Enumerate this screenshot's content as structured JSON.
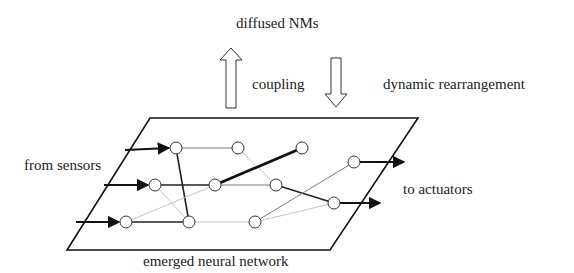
{
  "labels": {
    "top": "diffused NMs",
    "coupling": "coupling",
    "rearrangement": "dynamic rearrangement",
    "inputs": "from sensors",
    "outputs": "to actuators",
    "bottom": "emerged neural network"
  },
  "diagram": {
    "plane": [
      [
        150,
        118
      ],
      [
        418,
        118
      ],
      [
        330,
        250
      ],
      [
        67,
        250
      ]
    ],
    "nodes": [
      {
        "id": "A",
        "x": 176,
        "y": 148
      },
      {
        "id": "B",
        "x": 238,
        "y": 148
      },
      {
        "id": "C",
        "x": 302,
        "y": 148
      },
      {
        "id": "D",
        "x": 155,
        "y": 185
      },
      {
        "id": "E",
        "x": 215,
        "y": 185
      },
      {
        "id": "F",
        "x": 276,
        "y": 185
      },
      {
        "id": "G",
        "x": 354,
        "y": 162
      },
      {
        "id": "H",
        "x": 126,
        "y": 222
      },
      {
        "id": "I",
        "x": 189,
        "y": 222
      },
      {
        "id": "J",
        "x": 255,
        "y": 222
      },
      {
        "id": "K",
        "x": 334,
        "y": 203
      }
    ],
    "edges": [
      {
        "from": "A",
        "to": "B",
        "weight": "medium"
      },
      {
        "from": "A",
        "to": "I",
        "weight": "strong"
      },
      {
        "from": "B",
        "to": "F",
        "weight": "faint"
      },
      {
        "from": "E",
        "to": "C",
        "weight": "heavy"
      },
      {
        "from": "D",
        "to": "E",
        "weight": "strong"
      },
      {
        "from": "E",
        "to": "F",
        "weight": "medium"
      },
      {
        "from": "D",
        "to": "I",
        "weight": "faint"
      },
      {
        "from": "H",
        "to": "E",
        "weight": "faint"
      },
      {
        "from": "H",
        "to": "I",
        "weight": "strong"
      },
      {
        "from": "I",
        "to": "J",
        "weight": "faint"
      },
      {
        "from": "F",
        "to": "K",
        "weight": "strong"
      },
      {
        "from": "J",
        "to": "G",
        "weight": "medium"
      },
      {
        "from": "J",
        "to": "K",
        "weight": "faint"
      }
    ],
    "inputs": [
      {
        "from": [
          125,
          150
        ],
        "to": "A"
      },
      {
        "from": [
          104,
          185
        ],
        "to": "D"
      },
      {
        "from": [
          76,
          222
        ],
        "to": "H"
      }
    ],
    "outputs": [
      {
        "from": "G",
        "to": [
          404,
          162
        ]
      },
      {
        "from": "K",
        "to": [
          380,
          203
        ]
      }
    ]
  }
}
